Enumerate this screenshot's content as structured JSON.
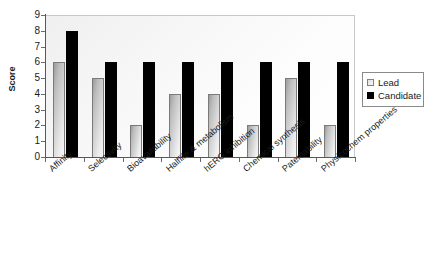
{
  "chart_data": {
    "type": "bar",
    "title": "",
    "xlabel": "",
    "ylabel": "Score",
    "ylim": [
      0,
      9
    ],
    "y_ticks": [
      0,
      1,
      2,
      3,
      4,
      5,
      6,
      7,
      8,
      9
    ],
    "grid": false,
    "legend_position": "right",
    "categories": [
      "Affinity",
      "Selectivity",
      "Bioavailability",
      "Halflife & metabolism",
      "hERG inhibition",
      "Chemical synthesis",
      "Patentability",
      "Physicochem properties"
    ],
    "series": [
      {
        "name": "Lead",
        "color": "#d9d9d9",
        "values": [
          6,
          5,
          2,
          4,
          4,
          2,
          5,
          2
        ]
      },
      {
        "name": "Candidate",
        "color": "#000000",
        "values": [
          8,
          6,
          6,
          6,
          6,
          6,
          6,
          6
        ]
      }
    ]
  },
  "axis": {
    "y_title": "Score",
    "y_tick_labels": [
      "9",
      "8",
      "7",
      "6",
      "5",
      "4",
      "3",
      "2",
      "1",
      "0"
    ]
  },
  "legend": {
    "items": [
      {
        "label": "Lead",
        "swatch": "lead-swatch"
      },
      {
        "label": "Candidate",
        "swatch": "candidate-swatch"
      }
    ]
  }
}
